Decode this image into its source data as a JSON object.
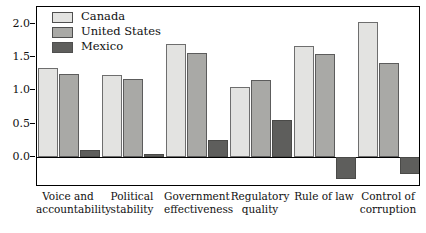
{
  "chart_data": {
    "type": "bar",
    "title": "",
    "subtitle": "",
    "xlabel": "",
    "ylabel": "",
    "categories": [
      "Voice and\naccountability",
      "Political\nstability",
      "Government\neffectiveness",
      "Regulatory\nquality",
      "Rule of law",
      "Control of\ncorruption"
    ],
    "series": [
      {
        "name": "Canada",
        "color": "#e3e3e1",
        "values": [
          1.33,
          1.23,
          1.7,
          1.05,
          1.67,
          2.02
        ]
      },
      {
        "name": "United States",
        "color": "#a9a9a6",
        "values": [
          1.24,
          1.17,
          1.56,
          1.16,
          1.54,
          1.41
        ]
      },
      {
        "name": "Mexico",
        "color": "#5e5e5c",
        "values": [
          0.11,
          0.04,
          0.25,
          0.55,
          -0.33,
          -0.25
        ]
      }
    ],
    "yticks": [
      "0.0",
      "0.5",
      "1.0",
      "1.5",
      "2.0"
    ],
    "ytick_values": [
      0.0,
      0.5,
      1.0,
      1.5,
      2.0
    ],
    "ylim": [
      -0.45,
      2.25
    ],
    "grid": false,
    "legend_position": "top-left"
  },
  "legend": {
    "items": [
      {
        "label": "Canada"
      },
      {
        "label": "United States"
      },
      {
        "label": "Mexico"
      }
    ]
  }
}
